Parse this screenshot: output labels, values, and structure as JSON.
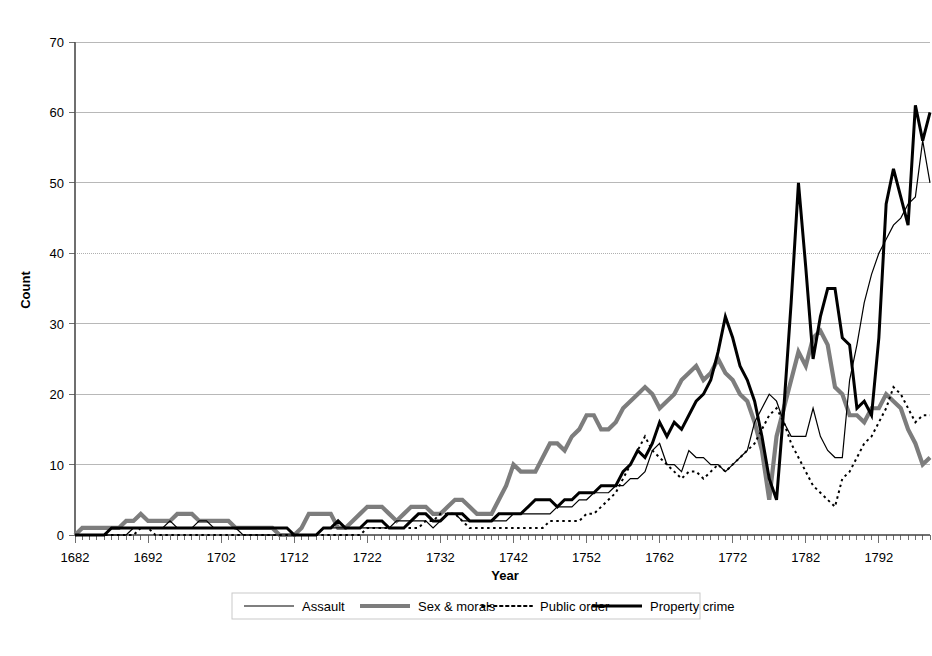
{
  "chart_data": {
    "type": "line",
    "title": "",
    "xlabel": "Year",
    "ylabel": "Count",
    "xlim": [
      1682,
      1799
    ],
    "ylim": [
      0,
      70
    ],
    "ytick_step": 10,
    "yticks": [
      0,
      10,
      20,
      30,
      40,
      50,
      60,
      70
    ],
    "xticks": [
      1682,
      1692,
      1702,
      1712,
      1722,
      1732,
      1742,
      1752,
      1762,
      1772,
      1782,
      1792
    ],
    "xtick_interval_minor": 1,
    "grid": "horizontal",
    "legend_position": "bottom",
    "x": [
      1682,
      1683,
      1684,
      1685,
      1686,
      1687,
      1688,
      1689,
      1690,
      1691,
      1692,
      1693,
      1694,
      1695,
      1696,
      1697,
      1698,
      1699,
      1700,
      1701,
      1702,
      1703,
      1704,
      1705,
      1706,
      1707,
      1708,
      1709,
      1710,
      1711,
      1712,
      1713,
      1714,
      1715,
      1716,
      1717,
      1718,
      1719,
      1720,
      1721,
      1722,
      1723,
      1724,
      1725,
      1726,
      1727,
      1728,
      1729,
      1730,
      1731,
      1732,
      1733,
      1734,
      1735,
      1736,
      1737,
      1738,
      1739,
      1740,
      1741,
      1742,
      1743,
      1744,
      1745,
      1746,
      1747,
      1748,
      1749,
      1750,
      1751,
      1752,
      1753,
      1754,
      1755,
      1756,
      1757,
      1758,
      1759,
      1760,
      1761,
      1762,
      1763,
      1764,
      1765,
      1766,
      1767,
      1768,
      1769,
      1770,
      1771,
      1772,
      1773,
      1774,
      1775,
      1776,
      1777,
      1778,
      1779,
      1780,
      1781,
      1782,
      1783,
      1784,
      1785,
      1786,
      1787,
      1788,
      1789,
      1790,
      1791,
      1792,
      1793,
      1794,
      1795,
      1796,
      1797,
      1798,
      1799
    ],
    "series": [
      {
        "name": "Assault",
        "style": "thin-solid",
        "color": "#000000",
        "width": 1.2,
        "values": [
          0,
          0,
          0,
          0,
          0,
          0,
          0,
          0,
          1,
          1,
          1,
          1,
          1,
          2,
          1,
          1,
          1,
          2,
          2,
          1,
          1,
          1,
          1,
          0,
          0,
          0,
          0,
          0,
          0,
          0,
          0,
          0,
          0,
          0,
          1,
          1,
          1,
          1,
          1,
          1,
          1,
          1,
          1,
          1,
          2,
          2,
          2,
          2,
          2,
          1,
          2,
          3,
          3,
          2,
          2,
          2,
          2,
          2,
          2,
          2,
          3,
          3,
          3,
          3,
          3,
          3,
          4,
          4,
          4,
          5,
          5,
          6,
          6,
          6,
          7,
          7,
          8,
          8,
          9,
          12,
          13,
          10,
          10,
          9,
          12,
          11,
          11,
          10,
          10,
          9,
          10,
          11,
          12,
          16,
          18,
          20,
          19,
          16,
          14,
          14,
          14,
          18,
          14,
          12,
          11,
          11,
          22,
          27,
          33,
          37,
          40,
          42,
          44,
          45,
          47,
          48,
          56,
          50
        ]
      },
      {
        "name": "Sex & morals",
        "style": "thick-solid-gray",
        "color": "#7d7d7d",
        "width": 4.2,
        "values": [
          0,
          1,
          1,
          1,
          1,
          1,
          1,
          2,
          2,
          3,
          2,
          2,
          2,
          2,
          3,
          3,
          3,
          2,
          2,
          2,
          2,
          2,
          1,
          1,
          1,
          1,
          1,
          1,
          0,
          0,
          0,
          1,
          3,
          3,
          3,
          3,
          1,
          1,
          2,
          3,
          4,
          4,
          4,
          3,
          2,
          3,
          4,
          4,
          4,
          3,
          3,
          4,
          5,
          5,
          4,
          3,
          3,
          3,
          5,
          7,
          10,
          9,
          9,
          9,
          11,
          13,
          13,
          12,
          14,
          15,
          17,
          17,
          15,
          15,
          16,
          18,
          19,
          20,
          21,
          20,
          18,
          19,
          20,
          22,
          23,
          24,
          22,
          23,
          25,
          23,
          22,
          20,
          19,
          16,
          12,
          5,
          14,
          18,
          22,
          26,
          24,
          28,
          29,
          27,
          21,
          20,
          17,
          17,
          16,
          18,
          18,
          20,
          19,
          18,
          15,
          13,
          10,
          11
        ]
      },
      {
        "name": "Public order",
        "style": "dotted",
        "color": "#000000",
        "width": 2.0,
        "values": [
          0,
          0,
          0,
          0,
          0,
          0,
          0,
          0,
          0,
          1,
          1,
          0,
          0,
          0,
          0,
          0,
          0,
          0,
          0,
          0,
          0,
          0,
          0,
          0,
          0,
          0,
          0,
          0,
          0,
          0,
          0,
          0,
          0,
          0,
          0,
          0,
          0,
          0,
          0,
          0,
          1,
          1,
          1,
          1,
          1,
          1,
          1,
          1,
          2,
          2,
          3,
          3,
          3,
          2,
          1,
          1,
          1,
          1,
          1,
          1,
          1,
          1,
          1,
          1,
          1,
          2,
          2,
          2,
          2,
          2,
          3,
          3,
          4,
          5,
          6,
          8,
          10,
          12,
          14,
          12,
          11,
          10,
          9,
          8,
          9,
          9,
          8,
          9,
          10,
          9,
          10,
          11,
          12,
          13,
          15,
          17,
          18,
          16,
          13,
          11,
          9,
          7,
          6,
          5,
          4,
          8,
          9,
          11,
          13,
          14,
          16,
          18,
          21,
          20,
          18,
          16,
          17,
          17
        ]
      },
      {
        "name": "Property crime",
        "style": "thick-solid-black",
        "color": "#000000",
        "width": 3.0,
        "values": [
          0,
          0,
          0,
          0,
          0,
          1,
          1,
          1,
          1,
          1,
          1,
          1,
          1,
          1,
          1,
          1,
          1,
          1,
          1,
          1,
          1,
          1,
          1,
          1,
          1,
          1,
          1,
          1,
          1,
          1,
          0,
          0,
          0,
          0,
          1,
          1,
          2,
          1,
          1,
          1,
          2,
          2,
          2,
          1,
          1,
          1,
          2,
          3,
          3,
          2,
          2,
          3,
          3,
          3,
          2,
          2,
          2,
          2,
          3,
          3,
          3,
          3,
          4,
          5,
          5,
          5,
          4,
          5,
          5,
          6,
          6,
          6,
          7,
          7,
          7,
          9,
          10,
          12,
          11,
          13,
          16,
          14,
          16,
          15,
          17,
          19,
          20,
          22,
          26,
          31,
          28,
          24,
          22,
          19,
          14,
          8,
          5,
          18,
          33,
          50,
          38,
          25,
          31,
          35,
          35,
          28,
          27,
          18,
          19,
          17,
          28,
          47,
          52,
          48,
          44,
          61,
          56,
          60
        ]
      }
    ],
    "legend_entries": [
      {
        "label": "Assault",
        "style": "thin-solid",
        "color": "#000000"
      },
      {
        "label": "Sex & morals",
        "style": "thick-solid-gray",
        "color": "#7d7d7d"
      },
      {
        "label": "Public order",
        "style": "dotted",
        "color": "#000000"
      },
      {
        "label": "Property crime",
        "style": "thick-solid-black",
        "color": "#000000"
      }
    ]
  }
}
